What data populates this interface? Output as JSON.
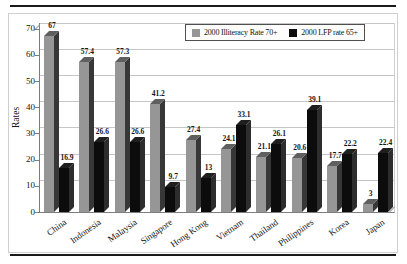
{
  "chart_data": {
    "type": "bar",
    "style": "3d-column",
    "title": "",
    "xlabel": "",
    "ylabel": "Rates",
    "categories": [
      "China",
      "Indonesia",
      "Malaysia",
      "Singapore",
      "Hong Kong",
      "Vietnam",
      "Thailand",
      "Philippines",
      "Korea",
      "Japan"
    ],
    "series": [
      {
        "name": "2000 Illiteracy Rate 70+",
        "values": [
          67,
          57.4,
          57.3,
          41.2,
          27.4,
          24.1,
          21.1,
          20.6,
          17.7,
          3
        ],
        "front_color": "#969696",
        "side_color": "#373737",
        "top_color": "#5f5f5f"
      },
      {
        "name": "2000 LFP rate 65+",
        "values": [
          16.9,
          26.6,
          26.6,
          9.7,
          13,
          33.1,
          26.1,
          39.1,
          22.2,
          22.4
        ],
        "front_color": "#0c0c0c",
        "side_color": "#2d2d2d",
        "top_color": "#1f1f1f"
      }
    ],
    "ylim": [
      0,
      70
    ],
    "yticks": [
      0,
      10,
      20,
      30,
      40,
      50,
      60,
      70
    ],
    "grid": true,
    "legend_position": "top-right",
    "colors": {
      "gridline": "#c6c6c6",
      "axis": "#7d7d7d",
      "frame_rules": "#1a1a1a"
    }
  }
}
